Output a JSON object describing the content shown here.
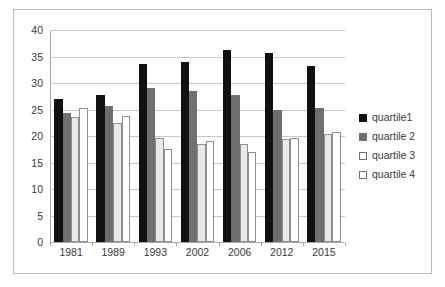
{
  "chart_data": {
    "type": "bar",
    "title": "",
    "subtitle": "",
    "xlabel": "",
    "ylabel": "",
    "categories": [
      "1981",
      "1989",
      "1993",
      "2002",
      "2006",
      "2012",
      "2015"
    ],
    "series": [
      {
        "name": "quartile1",
        "values": [
          26.9,
          27.8,
          33.6,
          34.0,
          36.3,
          35.6,
          33.2
        ]
      },
      {
        "name": "quartile 2",
        "values": [
          24.3,
          25.7,
          29.0,
          28.4,
          27.8,
          24.9,
          25.2
        ]
      },
      {
        "name": "quartile 3",
        "values": [
          23.6,
          22.4,
          19.6,
          18.5,
          18.5,
          19.4,
          20.4
        ]
      },
      {
        "name": "quartile 4",
        "values": [
          25.2,
          23.8,
          17.5,
          19.0,
          17.0,
          19.6,
          20.7
        ]
      }
    ],
    "ylim": [
      0,
      40
    ],
    "yticks": [
      "0",
      "5",
      "10",
      "15",
      "20",
      "25",
      "30",
      "35",
      "40"
    ],
    "grid": true,
    "legend_position": "right",
    "annotations": []
  },
  "colors": {
    "series_0": "#111111",
    "series_1": "#6f6f6f",
    "series_2": "#e9e9e9",
    "series_3": "#ffffff",
    "grid": "#c8c8c8",
    "axis": "#a8a8a8",
    "frame": "#b9b9b9",
    "text": "#3a3a3a",
    "background": "#ffffff"
  }
}
